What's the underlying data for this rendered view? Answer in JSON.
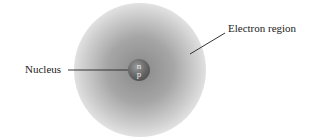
{
  "diagram": {
    "labels": {
      "nucleus": "Nucleus",
      "electron_region": "Electron region"
    },
    "nucleus": {
      "particle_1": "n",
      "particle_2": "p"
    },
    "colors": {
      "cloud": "#8c8c8c",
      "nucleus": "#5a5a5a",
      "line": "#333333"
    }
  }
}
